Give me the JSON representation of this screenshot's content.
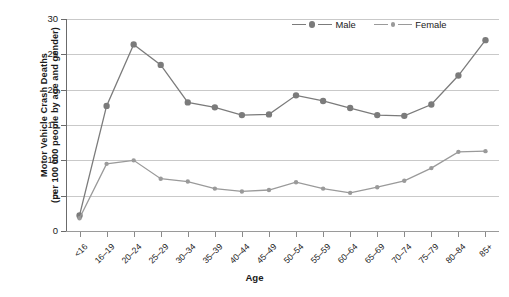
{
  "chart_data": {
    "type": "line",
    "title": "",
    "xlabel": "Age",
    "ylabel": "Motor Vehicle Crash Deaths (per 100 000 people by age and gender)",
    "ylabel_line1": "Motor Vehicle Crash Deaths",
    "ylabel_line2": "(per 100 000 people by age and gender)",
    "categories": [
      "<16",
      "16–19",
      "20–24",
      "25–29",
      "30–34",
      "35–39",
      "40–44",
      "45–49",
      "50–54",
      "55–59",
      "60–64",
      "65–69",
      "70–74",
      "75–79",
      "80–84",
      "85+"
    ],
    "series": [
      {
        "name": "Male",
        "color": "#7b7b7b",
        "marker_size": 4.6,
        "values": [
          2.2,
          17.7,
          26.4,
          23.5,
          18.2,
          17.5,
          16.4,
          16.5,
          19.2,
          18.4,
          17.4,
          16.4,
          16.3,
          17.9,
          22.0,
          27.0
        ]
      },
      {
        "name": "Female",
        "color": "#9a9a9a",
        "marker_size": 3.2,
        "values": [
          1.8,
          9.5,
          10.0,
          7.4,
          7.0,
          6.0,
          5.6,
          5.8,
          6.9,
          6.0,
          5.4,
          6.2,
          7.1,
          8.9,
          11.2,
          11.3
        ]
      }
    ],
    "ylim": [
      0,
      30
    ],
    "yticks": [
      0,
      5,
      10,
      15,
      20,
      25,
      30
    ],
    "ytick_labels": [
      "0",
      "5",
      "10",
      "15",
      "20",
      "25",
      "30"
    ],
    "grid": true,
    "grid_color": "#c9c9c9",
    "legend_position": "top-right",
    "axis_color": "#6b6b6b",
    "text_color": "#1a1a1a"
  },
  "legend": {
    "entries": [
      {
        "label": "Male"
      },
      {
        "label": "Female"
      }
    ]
  },
  "axes": {
    "x_title": "Age"
  }
}
